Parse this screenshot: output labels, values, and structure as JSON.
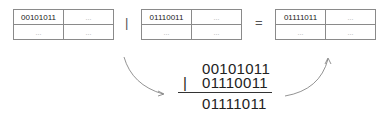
{
  "tables": [
    {
      "cells": [
        [
          "00101011",
          "..."
        ],
        [
          "...",
          "..."
        ]
      ]
    },
    {
      "cells": [
        [
          "01110011",
          "..."
        ],
        [
          "...",
          "..."
        ]
      ]
    },
    {
      "cells": [
        [
          "01111011",
          "..."
        ],
        [
          "...",
          "..."
        ]
      ]
    }
  ],
  "operators": {
    "or": "|",
    "equals": "="
  },
  "calculation": {
    "operand1": "00101011",
    "operator": "|",
    "operand2": "01110011",
    "result": "01111011"
  }
}
